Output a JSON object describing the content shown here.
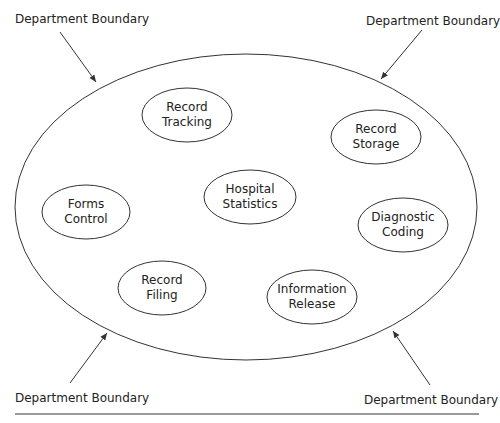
{
  "boundary_labels": {
    "top_left": "Department Boundary",
    "top_right": "Department Boundary",
    "bottom_left": "Department Boundary",
    "bottom_right": "Department Boundary"
  },
  "nodes": [
    {
      "line1": "Record",
      "line2": "Tracking"
    },
    {
      "line1": "Record",
      "line2": "Storage"
    },
    {
      "line1": "Forms",
      "line2": "Control"
    },
    {
      "line1": "Hospital",
      "line2": "Statistics"
    },
    {
      "line1": "Diagnostic",
      "line2": "Coding"
    },
    {
      "line1": "Record",
      "line2": "Filing"
    },
    {
      "line1": "Information",
      "line2": "Release"
    }
  ],
  "colors": {
    "stroke": "#333333",
    "text": "#222222"
  }
}
